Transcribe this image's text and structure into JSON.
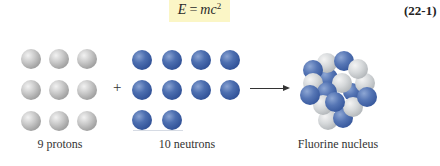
{
  "equation": {
    "lhs": "E",
    "operator": "=",
    "rhs_base": "mc",
    "rhs_exponent": "2",
    "number": "(22-1)",
    "highlight_color": "#fbf6c6"
  },
  "diagram": {
    "protons": {
      "count": 9,
      "label": "9 protons",
      "color": "#a8a8a8",
      "grid": {
        "rows": 3,
        "cols": 3
      }
    },
    "plus_sign": "+",
    "neutrons": {
      "count": 10,
      "label": "10 neutrons",
      "color": "#3d5fa0",
      "grid": {
        "rows": 3,
        "cols": 4,
        "last_row_count": 2
      }
    },
    "arrow": "right-arrow",
    "product": {
      "label": "Fluorine nucleus",
      "composition": {
        "protons": 9,
        "neutrons": 10
      }
    }
  }
}
